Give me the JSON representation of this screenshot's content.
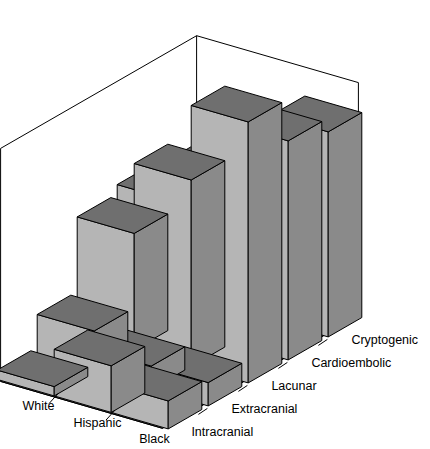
{
  "chart_data": {
    "type": "bar",
    "subtype": "3d-grouped-bar",
    "title": "",
    "subtitle": "",
    "xlabel": "",
    "ylabel": "",
    "zlabel": "",
    "categories": [
      "White",
      "Hispanic",
      "Black"
    ],
    "depth_categories": [
      "Intracranial",
      "Extracranial",
      "Lacunar",
      "Cardioembolic",
      "Cryptogenic"
    ],
    "ytick_labels": [
      "0%",
      "10%",
      "20%",
      "30%",
      "40%",
      "50%"
    ],
    "ytick_values": [
      0,
      10,
      20,
      30,
      40,
      50
    ],
    "ylim": [
      0,
      50
    ],
    "grid": false,
    "legend": "none",
    "series": [
      {
        "name": "Intracranial",
        "values": [
          2,
          10,
          6
        ]
      },
      {
        "name": "Extracranial",
        "values": [
          9,
          5,
          5
        ]
      },
      {
        "name": "Lacunar",
        "values": [
          25,
          40,
          56
        ]
      },
      {
        "name": "Cardioembolic",
        "values": [
          27,
          29,
          47
        ]
      },
      {
        "name": "Cryptogenic",
        "values": [
          26,
          30,
          44
        ]
      }
    ],
    "matrix": {
      "rows": [
        "White",
        "Hispanic",
        "Black"
      ],
      "columns": [
        "Intracranial",
        "Extracranial",
        "Lacunar",
        "Cardioembolic",
        "Cryptogenic"
      ],
      "values": [
        [
          2,
          9,
          25,
          27,
          26
        ],
        [
          10,
          5,
          40,
          29,
          30
        ],
        [
          6,
          5,
          56,
          47,
          44
        ]
      ]
    }
  },
  "style": {
    "bar_front": "#b5b5b5",
    "bar_side": "#8a8a8a",
    "bar_top": "#6f6f6f",
    "floor": "#9b9b9b",
    "outline": "#000000",
    "background": "#ffffff"
  }
}
